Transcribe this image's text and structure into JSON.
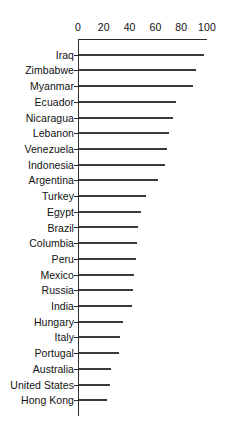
{
  "chart_data": {
    "type": "bar",
    "orientation": "horizontal",
    "title": "",
    "subtitle": "",
    "xlabel": "",
    "ylabel": "",
    "xlim": [
      0,
      100
    ],
    "xticks": [
      0,
      20,
      40,
      60,
      80,
      100
    ],
    "xtick_labels": [
      "0",
      "20",
      "40",
      "60",
      "80",
      "100"
    ],
    "grid": false,
    "legend": false,
    "legend_position": "none",
    "axis_position": "top",
    "bar_color": "#3a3a3a",
    "axis_color": "#2b2b2b",
    "categories": [
      "Iraq",
      "Zimbabwe",
      "Myanmar",
      "Ecuador",
      "Nicaragua",
      "Lebanon",
      "Venezuela",
      "Indonesia",
      "Argentina",
      "Turkey",
      "Egypt",
      "Brazil",
      "Columbia",
      "Peru",
      "Mexico",
      "Russia",
      "India",
      "Hungary",
      "Italy",
      "Portugal",
      "Australia",
      "United States",
      "Hong Kong"
    ],
    "values": [
      97,
      91,
      88,
      75,
      73,
      70,
      68,
      67,
      61,
      52,
      48,
      46,
      45,
      44,
      43,
      42,
      41,
      34,
      32,
      31,
      25,
      24,
      22
    ]
  }
}
